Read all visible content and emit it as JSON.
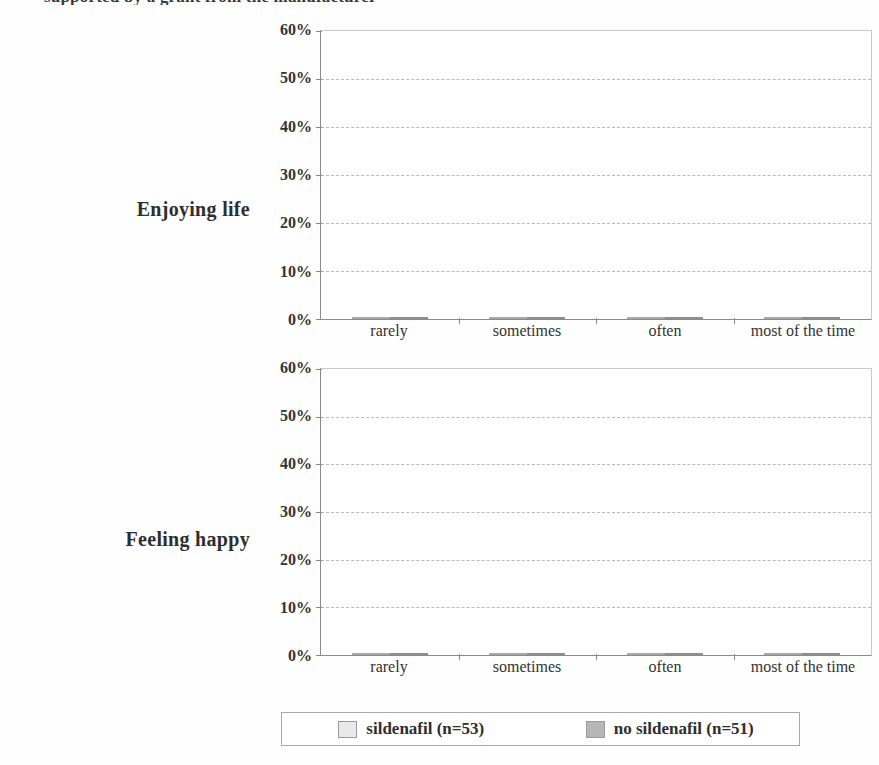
{
  "top_fragment": "supported by a grant from the manufacturer",
  "rows": [
    {
      "label": "Enjoying life"
    },
    {
      "label": "Feeling happy"
    }
  ],
  "legend": {
    "items": [
      {
        "label": "sildenafil (n=53)",
        "color": "#e9e9e9",
        "swatch": "legend-swatch-sildenafil"
      },
      {
        "label": "no sildenafil (n=51)",
        "color": "#b6b6b6",
        "swatch": "legend-swatch-no-sildenafil"
      }
    ]
  },
  "axis": {
    "yticks": [
      "0%",
      "10%",
      "20%",
      "30%",
      "40%",
      "50%",
      "60%"
    ],
    "categories": [
      "rarely",
      "sometimes",
      "often",
      "most of the time"
    ]
  },
  "chart_data": [
    {
      "type": "bar",
      "title": "Enjoying life",
      "categories": [
        "rarely",
        "sometimes",
        "often",
        "most of the time"
      ],
      "series": [
        {
          "name": "sildenafil (n=53)",
          "values": [
            7.5,
            11.5,
            23.5,
            59.0
          ],
          "color": "#e9e9e9"
        },
        {
          "name": "no sildenafil (n=51)",
          "values": [
            20.0,
            28.0,
            41.5,
            12.5
          ],
          "color": "#b6b6b6"
        }
      ],
      "xlabel": "",
      "ylabel": "",
      "ylim": [
        0,
        60
      ],
      "yticks": [
        0,
        10,
        20,
        30,
        40,
        50,
        60
      ],
      "ytick_labels": [
        "0%",
        "10%",
        "20%",
        "30%",
        "40%",
        "50%",
        "60%"
      ],
      "grid": true,
      "legend_position": "bottom"
    },
    {
      "type": "bar",
      "title": "Feeling happy",
      "categories": [
        "rarely",
        "sometimes",
        "often",
        "most of the time"
      ],
      "series": [
        {
          "name": "sildenafil (n=53)",
          "values": [
            2.0,
            7.5,
            40.0,
            51.5
          ],
          "color": "#e9e9e9"
        },
        {
          "name": "no sildenafil (n=51)",
          "values": [
            14.0,
            22.0,
            45.5,
            20.5
          ],
          "color": "#b6b6b6"
        }
      ],
      "xlabel": "",
      "ylabel": "",
      "ylim": [
        0,
        60
      ],
      "yticks": [
        0,
        10,
        20,
        30,
        40,
        50,
        60
      ],
      "ytick_labels": [
        "0%",
        "10%",
        "20%",
        "30%",
        "40%",
        "50%",
        "60%"
      ],
      "grid": true,
      "legend_position": "bottom"
    }
  ]
}
